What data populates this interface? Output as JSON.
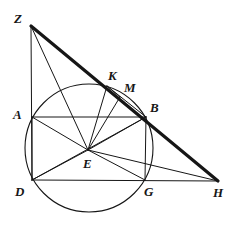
{
  "figure": {
    "background_color": "#ffffff",
    "stroke_color": "#161616",
    "thin_stroke_width": 1,
    "thick_stroke_width": 3.2,
    "circle_stroke_width": 1.1,
    "canvas": {
      "width": 232,
      "height": 229
    }
  },
  "points": [
    {
      "id": "Z",
      "label": "Z",
      "x": 31,
      "y": 26,
      "label_x": 14,
      "label_y": 12
    },
    {
      "id": "A",
      "label": "A",
      "x": 32,
      "y": 117,
      "label_x": 13,
      "label_y": 108
    },
    {
      "id": "D",
      "label": "D",
      "x": 32,
      "y": 180,
      "label_x": 15,
      "label_y": 185
    },
    {
      "id": "K",
      "label": "K",
      "x": 107,
      "y": 86,
      "label_x": 108,
      "label_y": 69
    },
    {
      "id": "M",
      "label": "M",
      "x": 120,
      "y": 97,
      "label_x": 124,
      "label_y": 81
    },
    {
      "id": "B",
      "label": "B",
      "x": 146,
      "y": 117,
      "label_x": 150,
      "label_y": 101
    },
    {
      "id": "E",
      "label": "E",
      "x": 88,
      "y": 150,
      "label_x": 83,
      "label_y": 157
    },
    {
      "id": "G",
      "label": "G",
      "x": 145,
      "y": 180,
      "label_x": 144,
      "label_y": 185
    },
    {
      "id": "H",
      "label": "H",
      "x": 218,
      "y": 181,
      "label_x": 213,
      "label_y": 186
    }
  ],
  "circle": {
    "name": "main-circle",
    "center_x": 89,
    "center_y": 148,
    "radius": 64
  },
  "thick_segments": [
    {
      "name": "segment-Z-H",
      "from": "Z",
      "to": "H",
      "x1": 31,
      "y1": 26,
      "x2": 218,
      "y2": 181
    }
  ],
  "thin_segments": [
    {
      "name": "segment-Z-D",
      "x1": 31,
      "y1": 26,
      "x2": 32,
      "y2": 180
    },
    {
      "name": "segment-D-H",
      "x1": 32,
      "y1": 180,
      "x2": 218,
      "y2": 181
    },
    {
      "name": "segment-A-B",
      "x1": 32,
      "y1": 117,
      "x2": 146,
      "y2": 117
    },
    {
      "name": "segment-B-G",
      "x1": 146,
      "y1": 117,
      "x2": 145,
      "y2": 180
    },
    {
      "name": "segment-A-D",
      "x1": 32,
      "y1": 117,
      "x2": 32,
      "y2": 180
    },
    {
      "name": "segment-Z-E",
      "x1": 31,
      "y1": 26,
      "x2": 88,
      "y2": 150
    },
    {
      "name": "segment-E-K",
      "x1": 88,
      "y1": 150,
      "x2": 107,
      "y2": 86
    },
    {
      "name": "segment-E-M",
      "x1": 88,
      "y1": 150,
      "x2": 120,
      "y2": 97
    },
    {
      "name": "segment-E-B",
      "x1": 88,
      "y1": 150,
      "x2": 146,
      "y2": 117
    },
    {
      "name": "segment-E-A",
      "x1": 88,
      "y1": 150,
      "x2": 32,
      "y2": 117
    },
    {
      "name": "segment-E-D",
      "x1": 88,
      "y1": 150,
      "x2": 32,
      "y2": 180
    },
    {
      "name": "segment-E-G",
      "x1": 88,
      "y1": 150,
      "x2": 145,
      "y2": 180
    },
    {
      "name": "segment-E-H",
      "x1": 88,
      "y1": 150,
      "x2": 218,
      "y2": 181
    },
    {
      "name": "segment-D-B",
      "x1": 32,
      "y1": 180,
      "x2": 146,
      "y2": 117
    },
    {
      "name": "segment-K-B",
      "x1": 107,
      "y1": 86,
      "x2": 146,
      "y2": 117
    },
    {
      "name": "segment-K-M",
      "x1": 107,
      "y1": 86,
      "x2": 120,
      "y2": 97
    }
  ]
}
